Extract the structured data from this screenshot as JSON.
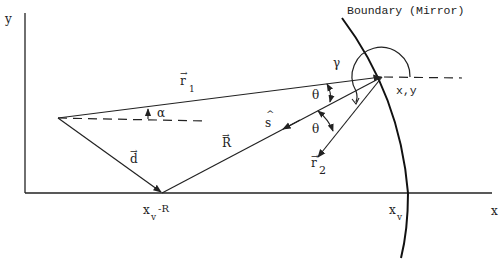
{
  "title": "Boundary (Mirror)",
  "axes": {
    "x_label": "x",
    "y_label": "y"
  },
  "vectors": {
    "r1": {
      "symbol": "r",
      "subscript": "1",
      "arrow": "→"
    },
    "r2": {
      "symbol": "r",
      "subscript": "2",
      "arrow": "→"
    },
    "d": {
      "symbol": "d",
      "arrow": "→"
    },
    "R": {
      "symbol": "R",
      "arrow": "→"
    },
    "s": {
      "symbol": "s",
      "hat": "^"
    }
  },
  "angles": {
    "alpha": "α",
    "theta_1": "θ",
    "theta_2": "θ",
    "gamma": "γ"
  },
  "points": {
    "mirror_point": "x,y",
    "xv_minus_R": {
      "base": "x",
      "subscript": "v",
      "suffix": "-R"
    },
    "xv": {
      "base": "x",
      "subscript": "v"
    }
  },
  "colors": {
    "ink": "#222222",
    "background": "#ffffff"
  }
}
